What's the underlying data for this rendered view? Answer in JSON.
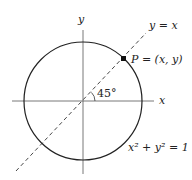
{
  "diagram": {
    "labels": {
      "y_axis": "y",
      "x_axis": "x",
      "line": "y = x",
      "point": "P = (x, y)",
      "angle": "45°",
      "equation": "x² + y² = 1"
    },
    "elements": {
      "circle": {
        "center": [
          83,
          101
        ],
        "radius": 59
      },
      "line_y_eq_x": {
        "style": "dashed",
        "from": [
          16,
          171
        ],
        "to": [
          145,
          33
        ]
      },
      "point_P": {
        "x": 124,
        "y": 59
      }
    }
  }
}
